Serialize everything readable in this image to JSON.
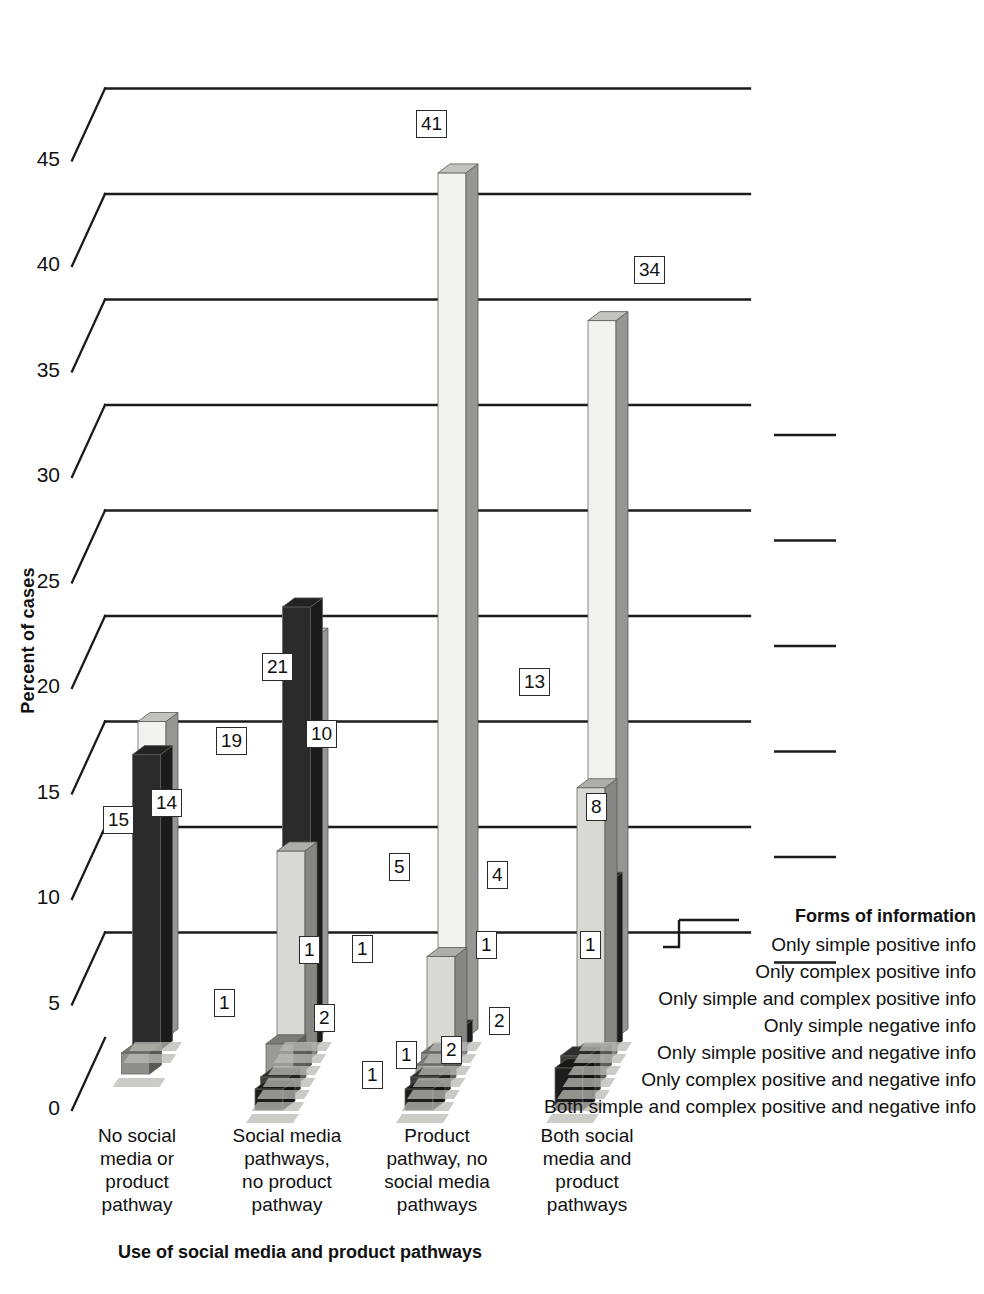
{
  "chart_data": {
    "type": "bar",
    "title": "",
    "xlabel": "Use of social media and product pathways",
    "ylabel": "Percent of cases",
    "ylim": [
      0,
      55
    ],
    "yticks": [
      0,
      5,
      10,
      15,
      20,
      25,
      30,
      35,
      40,
      45
    ],
    "ytick_labels": [
      "0",
      "5",
      "10",
      "15",
      "20",
      "25",
      "30",
      "35",
      "40",
      "45"
    ],
    "grid": true,
    "legend_position": "right",
    "legend_title": "Forms of information",
    "categories": [
      "No social media or product pathway",
      "Social media pathways, no product pathway",
      "Product pathway, no social media pathways",
      "Both social media and product pathways"
    ],
    "category_label_lines": [
      [
        "No social",
        "media or",
        "product",
        "pathway"
      ],
      [
        "Social media",
        "pathways,",
        "no product",
        "pathway"
      ],
      [
        "Product",
        "pathway, no",
        "social media",
        "pathways"
      ],
      [
        "Both social",
        "media and",
        "product",
        "pathways"
      ]
    ],
    "series": [
      {
        "name": "Only simple positive info",
        "color": "#f2f2f0",
        "values": [
          15,
          19,
          41,
          34
        ]
      },
      {
        "name": "Only complex positive info",
        "color": "#2b2b2b",
        "values": [
          14,
          21,
          1,
          8
        ]
      },
      {
        "name": "Only simple and complex positive info",
        "color": "#d8d8d4",
        "values": [
          0,
          10,
          5,
          13
        ]
      },
      {
        "name": "Only simple negative info",
        "color": "#8e8e8a",
        "values": [
          1,
          1,
          1,
          1
        ]
      },
      {
        "name": "Only simple positive and negative info",
        "color": "#9a9a96",
        "values": [
          0,
          2,
          1,
          1
        ]
      },
      {
        "name": "Only complex positive and negative info",
        "color": "#3a3a3a",
        "values": [
          0,
          1,
          1,
          2
        ]
      },
      {
        "name": "Both simple and complex positive and negative info",
        "color": "#1d1d1d",
        "values": [
          0,
          1,
          1,
          2
        ]
      }
    ],
    "data_labels": [
      {
        "text": "15",
        "x": 103,
        "y": 806
      },
      {
        "text": "14",
        "x": 151,
        "y": 789
      },
      {
        "text": "1",
        "x": 214,
        "y": 989
      },
      {
        "text": "19",
        "x": 216,
        "y": 727
      },
      {
        "text": "21",
        "x": 262,
        "y": 653
      },
      {
        "text": "10",
        "x": 306,
        "y": 720
      },
      {
        "text": "1",
        "x": 299,
        "y": 936
      },
      {
        "text": "2",
        "x": 314,
        "y": 1004
      },
      {
        "text": "1",
        "x": 352,
        "y": 935
      },
      {
        "text": "1",
        "x": 362,
        "y": 1061
      },
      {
        "text": "5",
        "x": 389,
        "y": 853
      },
      {
        "text": "1",
        "x": 396,
        "y": 1041
      },
      {
        "text": "41",
        "x": 416,
        "y": 110
      },
      {
        "text": "1",
        "x": 476,
        "y": 931
      },
      {
        "text": "13",
        "x": 519,
        "y": 668
      },
      {
        "text": "4",
        "x": 487,
        "y": 861
      },
      {
        "text": "2",
        "x": 441,
        "y": 1036
      },
      {
        "text": "2",
        "x": 489,
        "y": 1007
      },
      {
        "text": "8",
        "x": 586,
        "y": 793
      },
      {
        "text": "34",
        "x": 634,
        "y": 256
      },
      {
        "text": "1",
        "x": 580,
        "y": 931
      }
    ]
  }
}
